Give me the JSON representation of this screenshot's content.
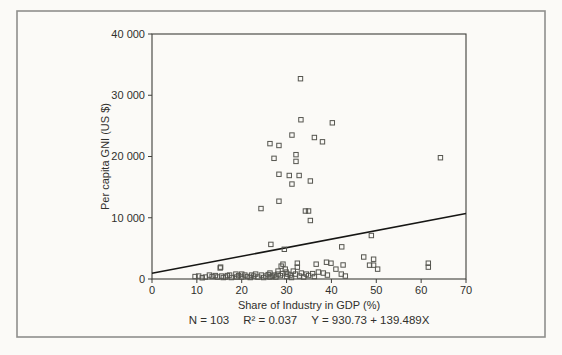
{
  "chart_data": {
    "type": "scatter",
    "title": "",
    "xlabel": "Share of Industry in GDP (%)",
    "ylabel": "Per capita GNI (US $)",
    "xlim": [
      0,
      70
    ],
    "ylim": [
      0,
      40000
    ],
    "grid": false,
    "legend": "none",
    "marker": "open-square",
    "xticks": {
      "values": [
        0,
        10,
        20,
        30,
        40,
        50,
        60,
        70
      ],
      "labels": [
        "0",
        "10",
        "20",
        "30",
        "40",
        "50",
        "60",
        "70"
      ]
    },
    "yticks": {
      "values": [
        0,
        10000,
        20000,
        30000,
        40000
      ],
      "labels": [
        "0",
        "10 000",
        "20 000",
        "30 000",
        "40 000"
      ]
    },
    "regression": {
      "intercept": 930.73,
      "slope": 139.489,
      "x_range": [
        0,
        70
      ]
    },
    "stats": {
      "n": "N = 103",
      "r_squared": "R² = 0.037",
      "equation": "Y = 930.73 + 139.489X"
    },
    "colors": {
      "paper": "#fbfaf7",
      "frame": "#8f8f8c",
      "axis": "#3f3f3b",
      "text": "#30302c",
      "point": "#55554f",
      "regression": "#161614"
    },
    "points": [
      [
        33.1,
        32700
      ],
      [
        33.2,
        26000
      ],
      [
        40.2,
        25500
      ],
      [
        31.2,
        23500
      ],
      [
        36.2,
        23100
      ],
      [
        26.3,
        22100
      ],
      [
        28.3,
        21800
      ],
      [
        38.0,
        22400
      ],
      [
        27.2,
        19700
      ],
      [
        32.1,
        20300
      ],
      [
        32.1,
        19200
      ],
      [
        64.3,
        19800
      ],
      [
        28.3,
        17100
      ],
      [
        30.6,
        16900
      ],
      [
        32.8,
        16900
      ],
      [
        35.3,
        16000
      ],
      [
        31.2,
        15500
      ],
      [
        28.3,
        12700
      ],
      [
        24.3,
        11500
      ],
      [
        34.2,
        11100
      ],
      [
        34.9,
        11100
      ],
      [
        35.3,
        9550
      ],
      [
        26.5,
        5650
      ],
      [
        29.5,
        4850
      ],
      [
        42.3,
        5250
      ],
      [
        48.9,
        7100
      ],
      [
        47.2,
        3590
      ],
      [
        49.4,
        3230
      ],
      [
        15.3,
        1940
      ],
      [
        28.8,
        2100
      ],
      [
        29.2,
        2420
      ],
      [
        32.4,
        2580
      ],
      [
        32.4,
        1940
      ],
      [
        36.6,
        2420
      ],
      [
        38.9,
        2740
      ],
      [
        39.9,
        2580
      ],
      [
        42.6,
        2290
      ],
      [
        61.6,
        2580
      ],
      [
        61.6,
        1940
      ],
      [
        48.5,
        2260
      ],
      [
        49.4,
        2260
      ],
      [
        50.3,
        1610
      ],
      [
        29.7,
        1610
      ],
      [
        9.6,
        400
      ],
      [
        10.4,
        480
      ],
      [
        11.9,
        320
      ],
      [
        12.8,
        640
      ],
      [
        14.6,
        320
      ],
      [
        15.2,
        1800
      ],
      [
        15.5,
        480
      ],
      [
        16.4,
        320
      ],
      [
        17.3,
        640
      ],
      [
        18.7,
        800
      ],
      [
        18.9,
        320
      ],
      [
        20.0,
        800
      ],
      [
        20.0,
        320
      ],
      [
        22.2,
        640
      ],
      [
        23.1,
        800
      ],
      [
        25.4,
        480
      ],
      [
        26.3,
        970
      ],
      [
        26.3,
        320
      ],
      [
        27.2,
        640
      ],
      [
        28.1,
        1290
      ],
      [
        28.1,
        800
      ],
      [
        29.9,
        1130
      ],
      [
        30.3,
        800
      ],
      [
        31.5,
        1290
      ],
      [
        33.3,
        970
      ],
      [
        34.4,
        800
      ],
      [
        37.1,
        1130
      ],
      [
        38.2,
        970
      ],
      [
        39.1,
        640
      ],
      [
        41.0,
        1610
      ],
      [
        42.2,
        800
      ],
      [
        43.1,
        480
      ],
      [
        11.2,
        200
      ],
      [
        13.4,
        400
      ],
      [
        14.1,
        560
      ],
      [
        15.9,
        240
      ],
      [
        16.8,
        560
      ],
      [
        17.7,
        240
      ],
      [
        19.3,
        560
      ],
      [
        20.7,
        640
      ],
      [
        21.3,
        400
      ],
      [
        21.9,
        240
      ],
      [
        22.7,
        480
      ],
      [
        23.6,
        320
      ],
      [
        24.4,
        640
      ],
      [
        24.9,
        240
      ],
      [
        25.9,
        720
      ],
      [
        26.8,
        480
      ],
      [
        27.6,
        320
      ],
      [
        28.6,
        560
      ],
      [
        29.1,
        880
      ],
      [
        30.0,
        400
      ],
      [
        30.8,
        640
      ],
      [
        31.1,
        240
      ],
      [
        32.0,
        800
      ],
      [
        32.9,
        480
      ],
      [
        33.8,
        320
      ],
      [
        34.9,
        560
      ],
      [
        35.8,
        880
      ],
      [
        36.2,
        400
      ]
    ]
  }
}
